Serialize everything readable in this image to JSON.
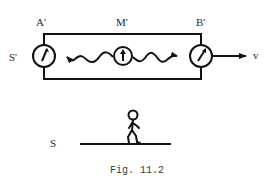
{
  "figure": {
    "caption": "Fig. 11.2",
    "frames": {
      "moving": {
        "label": "S'",
        "velocity_label": "v",
        "points": [
          {
            "id": "A",
            "label": "A'",
            "clock": "left-end clock"
          },
          {
            "id": "M",
            "label": "M'",
            "clock": "midpoint clock"
          },
          {
            "id": "B",
            "label": "B'",
            "clock": "right-end clock"
          }
        ]
      },
      "rest": {
        "label": "S"
      }
    },
    "colors": {
      "ink": "#111111",
      "background": "#ffffff"
    }
  }
}
